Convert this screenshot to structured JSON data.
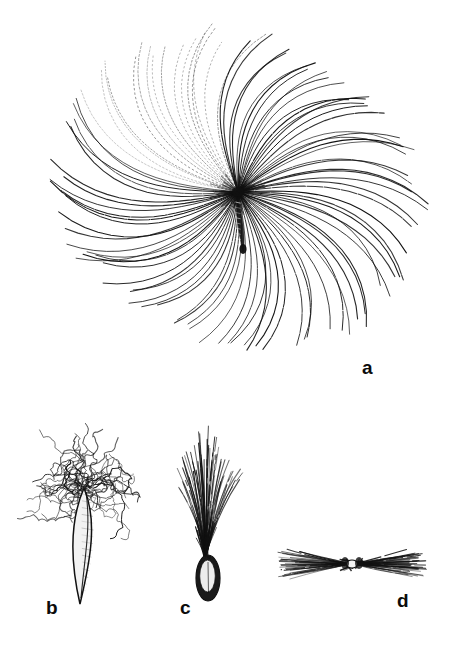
{
  "figure": {
    "kind": "botanical-line-drawing-plate",
    "background_color": "#ffffff",
    "ink_color": "#111111",
    "width": 462,
    "height": 650,
    "panel_count": 4
  },
  "panels": [
    {
      "key": "a",
      "label": "a",
      "label_position": {
        "x": 362,
        "y": 358
      },
      "subject": "achene with wide radiating plumose pappus (parachute / dandelion-type diaspore), face view",
      "layout": {
        "center": {
          "x": 238,
          "y": 192
        },
        "ray_count": 96,
        "radius_min": 128,
        "radius_max": 186,
        "curve_sweep_degrees": 26,
        "bounds": {
          "left": 66,
          "top": 24,
          "right": 412,
          "bottom": 392
        }
      },
      "achene": {
        "shape": "narrow-elongate",
        "top": {
          "x": 238,
          "y": 196
        },
        "bottom": {
          "x": 243,
          "y": 252
        },
        "width": 7
      },
      "faint_sector": {
        "note": "upper-left rays rendered as dotted / broken strokes",
        "start_angle_degrees": 188,
        "end_angle_degrees": 250
      }
    },
    {
      "key": "b",
      "label": "b",
      "label_position": {
        "x": 46,
        "y": 598
      },
      "subject": "achene with tangled mass of crisped wavy pappus hairs",
      "layout": {
        "bounds": {
          "left": 26,
          "top": 424,
          "right": 150,
          "bottom": 608
        },
        "hair_count": 46,
        "hair_style": "curly-crisped"
      },
      "achene": {
        "shape": "lanceolate-spindle, pale with dark outline, tapering to sharp point",
        "apex": {
          "x": 84,
          "y": 488
        },
        "tip": {
          "x": 80,
          "y": 604
        },
        "max_width": 24
      }
    },
    {
      "key": "c",
      "label": "c",
      "label_position": {
        "x": 180,
        "y": 598
      },
      "subject": "achene with narrow erect brush-like plume of straight bristles",
      "layout": {
        "bounds": {
          "left": 170,
          "top": 424,
          "right": 240,
          "bottom": 606
        },
        "bristle_count": 54,
        "bristle_style": "straight-fanned",
        "neck": {
          "x": 206,
          "y": 556
        }
      },
      "achene": {
        "shape": "ovoid-ellipsoid, dark rimmed with pale median groove",
        "center": {
          "x": 208,
          "y": 578
        },
        "width": 24,
        "height": 46
      }
    },
    {
      "key": "d",
      "label": "d",
      "label_position": {
        "x": 397,
        "y": 591
      },
      "subject": "pappus bundle pinched at the middle, hairs splayed to both sides (bow-tie / hourglass view)",
      "layout": {
        "bounds": {
          "left": 281,
          "top": 542,
          "right": 428,
          "bottom": 586
        },
        "waist": {
          "x": 352,
          "y": 564
        },
        "hair_count": 40,
        "spread_half_width": 72
      }
    }
  ],
  "labels": {
    "a": "a",
    "b": "b",
    "c": "c",
    "d": "d"
  }
}
